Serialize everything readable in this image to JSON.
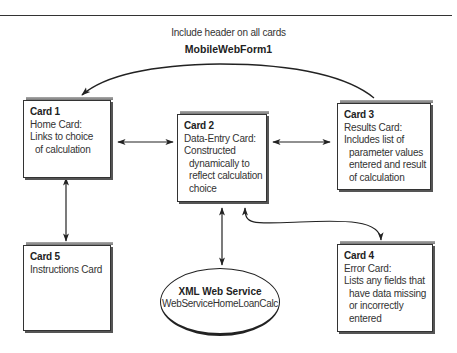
{
  "header": {
    "note": "Include header on all cards",
    "form_name": "MobileWebForm1"
  },
  "cards": [
    {
      "id": "card1",
      "title": "Card 1",
      "lines": [
        "Home Card:",
        "Links to choice",
        "of calculation"
      ]
    },
    {
      "id": "card2",
      "title": "Card 2",
      "lines": [
        "Data-Entry Card:",
        "Constructed",
        "dynamically to",
        "reflect calculation",
        "choice"
      ]
    },
    {
      "id": "card3",
      "title": "Card 3",
      "lines": [
        "Results Card:",
        "Includes list of",
        "parameter values",
        "entered and result",
        "of calculation"
      ]
    },
    {
      "id": "card4",
      "title": "Card 4",
      "lines": [
        "Error Card:",
        "Lists any fields that",
        "have data missing",
        "or incorrectly",
        "entered"
      ]
    },
    {
      "id": "card5",
      "title": "Card 5",
      "lines": [
        "Instructions Card"
      ]
    }
  ],
  "service": {
    "title": "XML Web Service",
    "name": "WebServiceHomeLoanCalc"
  },
  "connections": [
    {
      "from": "Card 3",
      "to": "Card 1",
      "type": "curved-arrow"
    },
    {
      "from": "Card 1",
      "to": "Card 2",
      "type": "bidirectional"
    },
    {
      "from": "Card 2",
      "to": "Card 3",
      "type": "bidirectional"
    },
    {
      "from": "Card 1",
      "to": "Card 5",
      "type": "bidirectional"
    },
    {
      "from": "Card 2",
      "to": "XML Web Service",
      "type": "bidirectional"
    },
    {
      "from": "Card 2",
      "to": "Card 4",
      "type": "curved-bidirectional"
    }
  ]
}
